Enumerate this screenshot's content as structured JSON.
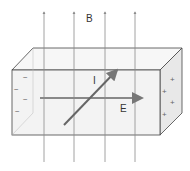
{
  "diagram": {
    "type": "hall-effect",
    "labels": {
      "magnetic_field": "B",
      "current": "I",
      "electric_field": "E"
    },
    "left_face_signs": [
      "−",
      "−",
      "−",
      "−"
    ],
    "right_face_signs": [
      "+",
      "+",
      "+",
      "+"
    ],
    "colors": {
      "field_lines": "#8a8a8a",
      "box_edges": "#444444",
      "arrows": "#777777",
      "faces": "#f2f2f2"
    }
  }
}
